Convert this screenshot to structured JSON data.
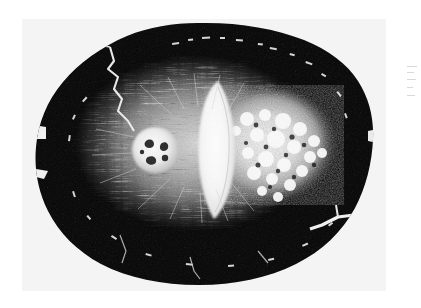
{
  "page": {
    "background_color": "#ffffff",
    "width": 421,
    "height": 308
  },
  "plate": {
    "label": "Cross-section photomicrograph",
    "background_color": "#f4f4f4",
    "left": 22,
    "top": 19,
    "width": 364,
    "height": 272,
    "caption": "",
    "monochrome": true
  },
  "specimen": {
    "name": "specimen-cross-section",
    "shape": "irregular ovoid",
    "outer_shell_color": "#050505",
    "highlight_color": "#ffffff",
    "mid_tone_color": "#8d8d8d",
    "center_x": 196,
    "center_y": 143,
    "radius_x": 176,
    "radius_y": 128,
    "description": "Dark ovoid outer cortex enclosing a lighter radially-fibrous inner zone"
  },
  "features": [
    {
      "id": "outer-cortex",
      "label": "Outer cortex ring",
      "tone": "black",
      "color": "#050505"
    },
    {
      "id": "radial-fiber-zone",
      "label": "Radiating fibrous inner zone",
      "tone": "mid-grey",
      "color": "#9a9a9a"
    },
    {
      "id": "central-wedge",
      "label": "Central bright wedge",
      "tone": "white",
      "color": "#fbfbfb",
      "center_x": 216,
      "center_y": 142
    },
    {
      "id": "circular-inclusion",
      "label": "Circular bright inclusion",
      "tone": "white",
      "color": "#f2f2f2",
      "center_x": 155,
      "center_y": 150,
      "radius": 22
    },
    {
      "id": "vesicular-mass",
      "label": "Vesicular bright mass",
      "tone": "white",
      "color": "#f0f0f0",
      "center_x": 272,
      "center_y": 145
    },
    {
      "id": "upper-left-fissure",
      "label": "Upper-left radial crack",
      "tone": "white",
      "color": "#ededed"
    },
    {
      "id": "lower-right-fissure",
      "label": "Lower-right branching crack",
      "tone": "white",
      "color": "#f5f5f5"
    }
  ],
  "margin_marks": {
    "label": "Scan edge tick artifacts",
    "count": 5,
    "color": "#d9d9d9"
  }
}
